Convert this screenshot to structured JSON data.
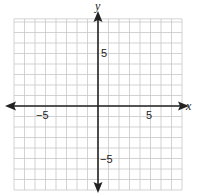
{
  "diagram": {
    "type": "coordinate-plane",
    "axes": {
      "x": {
        "label": "x",
        "ticks_labeled": [
          -5,
          5
        ],
        "range": [
          -8,
          8
        ]
      },
      "y": {
        "label": "y",
        "ticks_labeled": [
          5,
          -5
        ],
        "range": [
          -8,
          8.3
        ]
      }
    },
    "labels": {
      "x_neg": "−5",
      "x_pos": "5",
      "y_pos": "5",
      "y_neg": "−5",
      "x_axis": "x",
      "y_axis": "y"
    },
    "grid": {
      "unit_px": 10.5,
      "origin_px": [
        98,
        106
      ],
      "line_color": "#c8c8c8",
      "axis_color": "#222222"
    }
  }
}
